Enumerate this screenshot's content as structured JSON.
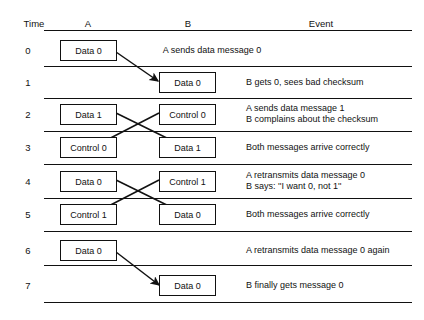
{
  "diagram": {
    "columns": [
      {
        "label": "Time"
      },
      {
        "label": "A"
      },
      {
        "label": "B"
      },
      {
        "label": "Event"
      }
    ],
    "rows": [
      {
        "time": "0",
        "a_box": "Data 0",
        "b_box": null,
        "event_lines": [
          "A sends data message 0"
        ],
        "event_centered": true
      },
      {
        "time": "1",
        "a_box": null,
        "b_box": "Data 0",
        "event_lines": [
          "B gets 0, sees bad checksum"
        ],
        "event_centered": false
      },
      {
        "time": "2",
        "a_box": "Data 1",
        "b_box": "Control 0",
        "event_lines": [
          "A sends data message 1",
          "B complains about the checksum"
        ],
        "event_centered": false
      },
      {
        "time": "3",
        "a_box": "Control 0",
        "b_box": "Data 1",
        "event_lines": [
          "Both messages arrive correctly"
        ],
        "event_centered": false
      },
      {
        "time": "4",
        "a_box": "Data 0",
        "b_box": "Control 1",
        "event_lines": [
          "A retransmits data message 0",
          "B says: ''I want 0, not 1''"
        ],
        "event_centered": false
      },
      {
        "time": "5",
        "a_box": "Control 1",
        "b_box": "Data 0",
        "event_lines": [
          "Both messages arrive correctly"
        ],
        "event_centered": false
      },
      {
        "time": "6",
        "a_box": "Data 0",
        "b_box": null,
        "event_lines": [
          "A retransmits data message 0 again"
        ],
        "event_centered": false
      },
      {
        "time": "7",
        "a_box": null,
        "b_box": "Data 0",
        "event_lines": [
          "B finally gets message 0"
        ],
        "event_centered": false
      }
    ],
    "colors": {
      "ink": "#111111",
      "paper": "#ffffff"
    }
  }
}
